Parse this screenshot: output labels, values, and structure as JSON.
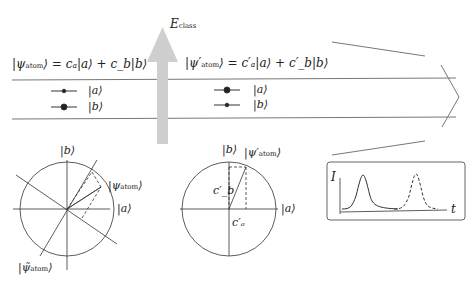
{
  "field": {
    "label": "E",
    "label_sub": "class"
  },
  "before": {
    "state_eq": "|ψ⟩ = cₐ|a⟩ + c_b|b⟩",
    "state_ket_prefix": "|ψ",
    "state_ket_sub": "atom",
    "state_rhs": "⟩ = cₐ|a⟩ + c_b|b⟩",
    "levels": [
      {
        "label": "|a⟩",
        "dot_size": "small"
      },
      {
        "label": "|b⟩",
        "dot_size": "large"
      }
    ]
  },
  "after": {
    "state_ket_prefix": "|ψ′",
    "state_ket_sub": "atom",
    "state_rhs": "⟩ = c′ₐ|a⟩ + c′_b|b⟩",
    "levels": [
      {
        "label": "|a⟩",
        "dot_size": "large"
      },
      {
        "label": "|b⟩",
        "dot_size": "small"
      }
    ]
  },
  "bloch_left": {
    "axis_b": "|b⟩",
    "axis_a": "|a⟩",
    "psi_prefix": "|ψ",
    "psi_sub": "atom",
    "psi_suffix": "⟩",
    "psi_tilde_prefix": "|ψ̃",
    "psi_tilde_sub": "atom",
    "psi_tilde_suffix": "⟩"
  },
  "bloch_right": {
    "axis_b": "|b⟩",
    "axis_a": "|a⟩",
    "psi_prefix": "|ψ′",
    "psi_sub": "atom",
    "psi_suffix": "⟩",
    "cb": "c′_b",
    "ca": "c′ₐ"
  },
  "pulse_plot": {
    "ylabel": "I",
    "xlabel": "t"
  }
}
